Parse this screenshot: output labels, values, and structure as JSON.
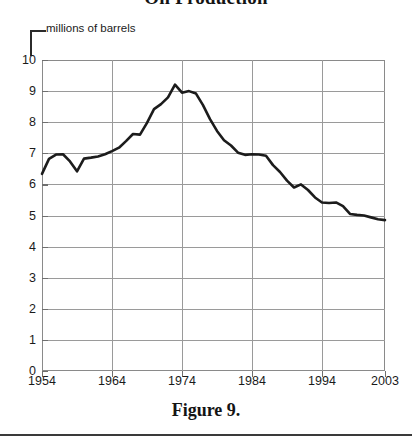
{
  "title": "Oil Production",
  "units_label": "millions of barrels",
  "caption": "Figure 9.",
  "colors": {
    "line": "#1c1c1c",
    "grid": "#9a9a9a",
    "frame": "#8a8a8a",
    "text": "#1a1a1a",
    "background": "#ffffff"
  },
  "axes": {
    "y_ticks": [
      "0",
      "1",
      "2",
      "3",
      "4",
      "5",
      "6",
      "7",
      "8",
      "9",
      "10"
    ],
    "x_ticks": [
      "1954",
      "1964",
      "1974",
      "1984",
      "1994",
      "2003"
    ]
  },
  "chart_data": {
    "type": "line",
    "title": "Oil Production",
    "subtitle": "",
    "xlabel": "",
    "ylabel": "millions of barrels",
    "xlim": [
      1954,
      2003
    ],
    "ylim": [
      0,
      10
    ],
    "grid": true,
    "legend": "none",
    "annotations": [
      {
        "text": "millions of barrels",
        "points_to": "y-axis",
        "x": 1954,
        "y": 10
      }
    ],
    "x_tick_labels": [
      "1954",
      "1964",
      "1974",
      "1984",
      "1994",
      "2003"
    ],
    "x_tick_values": [
      1954,
      1964,
      1974,
      1984,
      1994,
      2003
    ],
    "y_tick_labels": [
      "0",
      "1",
      "2",
      "3",
      "4",
      "5",
      "6",
      "7",
      "8",
      "9",
      "10"
    ],
    "y_tick_values": [
      0,
      1,
      2,
      3,
      4,
      5,
      6,
      7,
      8,
      9,
      10
    ],
    "series": [
      {
        "name": "Oil production",
        "x": [
          1954,
          1955,
          1956,
          1957,
          1958,
          1959,
          1960,
          1961,
          1962,
          1963,
          1964,
          1965,
          1966,
          1967,
          1968,
          1969,
          1970,
          1971,
          1972,
          1973,
          1974,
          1975,
          1976,
          1977,
          1978,
          1979,
          1980,
          1981,
          1982,
          1983,
          1984,
          1985,
          1986,
          1987,
          1988,
          1989,
          1990,
          1991,
          1992,
          1993,
          1994,
          1995,
          1996,
          1997,
          1998,
          1999,
          2000,
          2001,
          2002,
          2003
        ],
        "values": [
          6.34,
          6.81,
          6.95,
          6.96,
          6.71,
          6.9,
          7.04,
          7.18,
          7.33,
          7.54,
          7.61,
          7.8,
          8.3,
          8.81,
          9.1,
          9.24,
          9.64,
          9.46,
          9.44,
          9.21,
          8.77,
          8.37,
          8.13,
          8.25,
          8.71,
          8.55,
          8.6,
          8.57,
          8.65,
          8.69,
          8.88,
          8.97,
          8.68,
          8.35,
          8.14,
          7.61,
          7.36,
          7.42,
          7.17,
          6.85,
          6.66,
          6.56,
          6.47,
          6.45,
          6.25,
          5.88,
          5.82,
          5.8,
          5.75,
          5.68
        ]
      }
    ],
    "series_scaled_note": "Values plotted on 0-10 scale; peak ~9.2 near 1970, endpoint ~4.85 at 2003"
  },
  "plot_points": {
    "comment": "normalized polyline in plot coordinates (0-1 x, value 0-10 y)",
    "data": [
      [
        1954,
        6.34
      ],
      [
        1955,
        6.82
      ],
      [
        1956,
        6.96
      ],
      [
        1957,
        6.97
      ],
      [
        1958,
        6.74
      ],
      [
        1959,
        6.42
      ],
      [
        1960,
        6.83
      ],
      [
        1961,
        6.86
      ],
      [
        1962,
        6.9
      ],
      [
        1963,
        6.97
      ],
      [
        1964,
        7.07
      ],
      [
        1965,
        7.18
      ],
      [
        1966,
        7.39
      ],
      [
        1967,
        7.62
      ],
      [
        1968,
        7.6
      ],
      [
        1969,
        7.98
      ],
      [
        1970,
        8.42
      ],
      [
        1971,
        8.58
      ],
      [
        1972,
        8.8
      ],
      [
        1973,
        9.21
      ],
      [
        1974,
        8.95
      ],
      [
        1975,
        9.0
      ],
      [
        1976,
        8.92
      ],
      [
        1977,
        8.55
      ],
      [
        1978,
        8.1
      ],
      [
        1979,
        7.72
      ],
      [
        1980,
        7.42
      ],
      [
        1981,
        7.25
      ],
      [
        1982,
        7.02
      ],
      [
        1983,
        6.95
      ],
      [
        1984,
        6.97
      ],
      [
        1985,
        6.96
      ],
      [
        1986,
        6.92
      ],
      [
        1987,
        6.62
      ],
      [
        1988,
        6.4
      ],
      [
        1989,
        6.12
      ],
      [
        1990,
        5.9
      ],
      [
        1991,
        6.0
      ],
      [
        1992,
        5.82
      ],
      [
        1993,
        5.58
      ],
      [
        1994,
        5.42
      ],
      [
        1995,
        5.4
      ],
      [
        1996,
        5.42
      ],
      [
        1997,
        5.3
      ],
      [
        1998,
        5.05
      ],
      [
        1999,
        5.02
      ],
      [
        2000,
        5.0
      ],
      [
        2001,
        4.94
      ],
      [
        2002,
        4.88
      ],
      [
        2003,
        4.85
      ]
    ]
  }
}
